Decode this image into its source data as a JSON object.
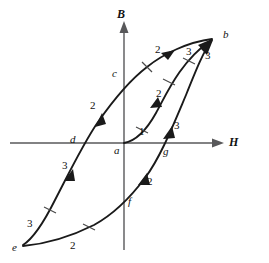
{
  "figure": {
    "type": "diagram",
    "background_color": "#ffffff",
    "curve_color": "#1a1a1a",
    "axis_color": "#58585a"
  },
  "axes": {
    "x": {
      "label": "H",
      "arrow": "right",
      "origin_label": "a"
    },
    "y": {
      "label": "B",
      "arrow": "up"
    }
  },
  "points": [
    {
      "id": "a",
      "label": "a",
      "desc": "origin / demagnetized state",
      "x": 124,
      "y": 143
    },
    {
      "id": "b",
      "label": "b",
      "desc": "positive saturation",
      "x": 213,
      "y": 38
    },
    {
      "id": "c",
      "label": "c",
      "desc": "positive remanence on B axis",
      "x": 124,
      "y": 75
    },
    {
      "id": "d",
      "label": "d",
      "desc": "negative coercivity on H axis",
      "x": 77,
      "y": 143
    },
    {
      "id": "e",
      "label": "e",
      "desc": "negative saturation",
      "x": 22,
      "y": 245
    },
    {
      "id": "f",
      "label": "f",
      "desc": "negative remanence on B axis",
      "x": 124,
      "y": 205
    },
    {
      "id": "g",
      "label": "g",
      "desc": "positive coercivity on H axis",
      "x": 168,
      "y": 143
    }
  ],
  "segment_labels": [
    {
      "text": "1",
      "x": 139,
      "y": 126,
      "branch": "virgin-curve a-to-b"
    },
    {
      "text": "2",
      "x": 156,
      "y": 94,
      "branch": "virgin-curve a-to-b"
    },
    {
      "text": "3",
      "x": 190,
      "y": 52,
      "branch": "virgin-curve a-to-b"
    },
    {
      "text": "3",
      "x": 155,
      "y": 48,
      "branch": "descending b-to-e"
    },
    {
      "text": "2",
      "x": 90,
      "y": 106,
      "branch": "descending b-to-e"
    },
    {
      "text": "2",
      "x": 62,
      "y": 163,
      "branch": "descending b-to-e"
    },
    {
      "text": "3",
      "x": 28,
      "y": 222,
      "branch": "descending b-to-e"
    },
    {
      "text": "3",
      "x": 70,
      "y": 239,
      "branch": "ascending e-to-b"
    },
    {
      "text": "2",
      "x": 146,
      "y": 176,
      "branch": "ascending e-to-b"
    },
    {
      "text": "2",
      "x": 173,
      "y": 124,
      "branch": "ascending e-to-b"
    },
    {
      "text": "3",
      "x": 208,
      "y": 56,
      "branch": "ascending e-to-b"
    }
  ],
  "branches": [
    {
      "id": "virgin",
      "from": "a",
      "to": "b",
      "direction": "up-right",
      "segments": [
        "1",
        "2",
        "3"
      ]
    },
    {
      "id": "descending",
      "from": "b",
      "to": "e",
      "direction": "down-left",
      "segments": [
        "3",
        "2",
        "2",
        "3"
      ],
      "crosses": [
        "c",
        "d"
      ]
    },
    {
      "id": "ascending",
      "from": "e",
      "to": "b",
      "direction": "up-right",
      "segments": [
        "3",
        "2",
        "2",
        "3"
      ],
      "crosses": [
        "f",
        "g"
      ]
    }
  ]
}
